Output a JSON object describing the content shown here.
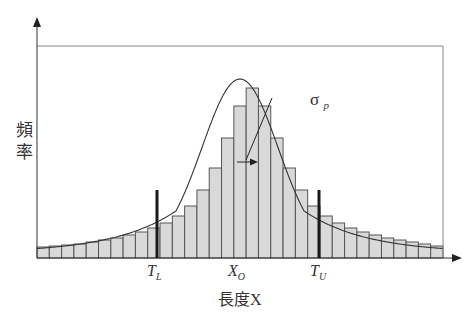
{
  "chart_data": {
    "type": "bar",
    "title": "",
    "xlabel": "長度X",
    "ylabel": "頻率",
    "x_tick_labels": [
      {
        "main": "T",
        "sub": "L",
        "x_px": 155
      },
      {
        "main": "X",
        "sub": "O",
        "x_px": 237
      },
      {
        "main": "T",
        "sub": "U",
        "x_px": 319
      }
    ],
    "annotation": {
      "main": "σ",
      "sub": "p",
      "meaning": "process standard deviation indicated by arrow from center"
    },
    "bar_count": 33,
    "bin_width_px": 12.3,
    "plot_area": {
      "left": 37,
      "right": 443,
      "top": 46,
      "baseline": 258
    },
    "values": [
      11,
      12,
      13,
      14,
      16,
      18,
      20,
      23,
      26,
      30,
      35,
      42,
      52,
      68,
      90,
      120,
      152,
      170,
      152,
      120,
      90,
      68,
      52,
      42,
      35,
      30,
      26,
      23,
      20,
      18,
      16,
      14,
      12
    ],
    "ylim": [
      0,
      212
    ],
    "grid": false,
    "legend": null,
    "markers": [
      {
        "name": "lower-limit",
        "label": "T_L",
        "x_px": 157,
        "top_px": 190
      },
      {
        "name": "upper-limit",
        "label": "T_U",
        "x_px": 319,
        "top_px": 190
      }
    ],
    "colors": {
      "bar_fill": "#d9d9d9",
      "bar_stroke": "#555555",
      "curve": "#333333",
      "axis": "#333333",
      "frame": "#888888",
      "marker": "#1a1a1a"
    }
  },
  "labels": {
    "ylabel_line1": "頻",
    "ylabel_line2": "率",
    "xlabel": "長度X",
    "tl_main": "T",
    "tl_sub": "L",
    "xo_main": "X",
    "xo_sub": "O",
    "tu_main": "T",
    "tu_sub": "U",
    "sigma_main": "σ",
    "sigma_sub": "p"
  }
}
